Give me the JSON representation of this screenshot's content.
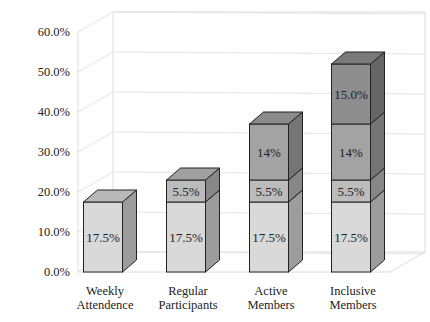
{
  "chart_data": {
    "type": "bar",
    "stacked": true,
    "three_d": true,
    "title": "",
    "xlabel": "",
    "ylabel": "",
    "ylim": [
      0,
      60
    ],
    "y_ticks": [
      "0.0%",
      "10.0%",
      "20.0%",
      "30.0%",
      "40.0%",
      "50.0%",
      "60.0%"
    ],
    "grid": true,
    "legend": null,
    "categories": [
      {
        "line1": "Weekly",
        "line2": "Attendence"
      },
      {
        "line1": "Regular",
        "line2": "Participants"
      },
      {
        "line1": "Active",
        "line2": "Members"
      },
      {
        "line1": "Inclusive",
        "line2": "Members"
      }
    ],
    "series": [
      {
        "name": "Segment 1",
        "color": "#d9d9d9",
        "values": [
          17.5,
          17.5,
          17.5,
          17.5
        ],
        "labels": [
          "17.5%",
          "17.5%",
          "17.5%",
          "17.5%"
        ]
      },
      {
        "name": "Segment 2",
        "color": "#bcbcbc",
        "values": [
          null,
          5.5,
          5.5,
          5.5
        ],
        "labels": [
          "",
          "5.5%",
          "5.5%",
          "5.5%"
        ]
      },
      {
        "name": "Segment 3",
        "color": "#a3a3a3",
        "values": [
          null,
          null,
          14,
          14
        ],
        "labels": [
          "",
          "",
          "14%",
          "14%"
        ]
      },
      {
        "name": "Segment 4",
        "color": "#8e8e8e",
        "values": [
          null,
          null,
          null,
          15.0
        ],
        "labels": [
          "",
          "",
          "",
          "15.0%"
        ]
      }
    ]
  }
}
